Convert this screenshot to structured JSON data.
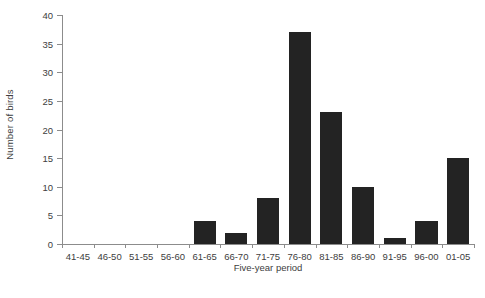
{
  "chart_data": {
    "type": "bar",
    "title": "",
    "xlabel": "Five-year period",
    "ylabel": "Number of birds",
    "categories": [
      "41-45",
      "46-50",
      "51-55",
      "56-60",
      "61-65",
      "66-70",
      "71-75",
      "76-80",
      "81-85",
      "86-90",
      "91-95",
      "96-00",
      "01-05"
    ],
    "values": [
      0,
      0,
      0,
      0,
      4,
      2,
      8,
      37,
      23,
      10,
      1,
      4,
      15
    ],
    "ylim": [
      0,
      40
    ],
    "yticks": [
      0,
      5,
      10,
      15,
      20,
      25,
      30,
      35,
      40
    ],
    "ytick_labels": [
      "0",
      "5",
      "10",
      "15",
      "20",
      "25",
      "30",
      "35",
      "40"
    ],
    "grid": false,
    "legend": null,
    "bar_color": "#232323",
    "axis_color": "#8c8c8c",
    "background": "#ffffff"
  }
}
